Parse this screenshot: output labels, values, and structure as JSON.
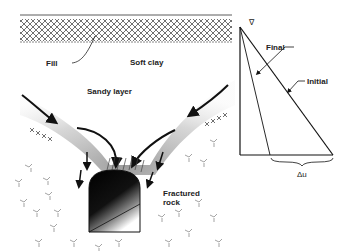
{
  "diagram": {
    "labels": {
      "fill": "Fill",
      "soft_clay": "Soft clay",
      "sandy_layer": "Sandy layer",
      "fractured_rock": "Fractured rock",
      "fractured_rock_line1": "Fractured",
      "fractured_rock_line2": "rock",
      "final": "Final",
      "initial": "Initial",
      "delta_u": "Δu",
      "water_table_symbol": "∇"
    },
    "colors": {
      "ink": "#222222",
      "sand": "#9a9a9a",
      "background": "#ffffff"
    }
  }
}
